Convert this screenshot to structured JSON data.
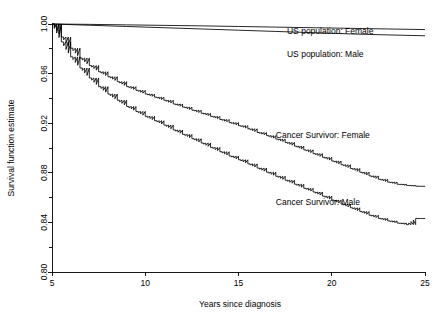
{
  "chart_data": {
    "type": "line",
    "title": "",
    "xlabel": "Years since diagnosis",
    "ylabel": "Survival function estimate",
    "xlim": [
      5,
      25
    ],
    "ylim": [
      0.8,
      1.0
    ],
    "xticks": [
      5,
      10,
      15,
      20,
      25
    ],
    "xtick_labels": [
      "5",
      "10",
      "15",
      "20",
      "25"
    ],
    "yticks": [
      0.8,
      0.84,
      0.88,
      0.92,
      0.96,
      1.0
    ],
    "ytick_labels": [
      "0.80",
      "0.84",
      "0.88",
      "0.92",
      "0.96",
      "1.00"
    ],
    "yminorticks": [
      0.82,
      0.86,
      0.9,
      0.94,
      0.98
    ],
    "grid": false,
    "legend_position": "inline-annotations",
    "series": [
      {
        "name": "US population: Female",
        "color": "#000000",
        "label_x": 17.6,
        "label_y": 0.9935,
        "x": [
          5,
          7,
          9,
          11,
          13,
          15,
          17,
          19,
          21,
          23,
          25
        ],
        "y": [
          1.0,
          0.9997,
          0.9993,
          0.9989,
          0.9985,
          0.998,
          0.9975,
          0.997,
          0.9965,
          0.996,
          0.9955
        ]
      },
      {
        "name": "US population: Male",
        "color": "#000000",
        "label_x": 17.6,
        "label_y": 0.9755,
        "x": [
          5,
          7,
          9,
          11,
          13,
          15,
          17,
          19,
          21,
          23,
          25
        ],
        "y": [
          1.0,
          0.999,
          0.998,
          0.997,
          0.996,
          0.995,
          0.994,
          0.993,
          0.992,
          0.9912,
          0.9905
        ]
      },
      {
        "name": "Cancer Survivor: Female",
        "color": "#000000",
        "label_x": 17.0,
        "label_y": 0.9095,
        "x": [
          5,
          5.5,
          6,
          6.5,
          7,
          7.5,
          8,
          8.5,
          9,
          9.5,
          10,
          10.5,
          11,
          11.5,
          12,
          12.5,
          13,
          13.5,
          14,
          14.5,
          15,
          15.5,
          16,
          16.5,
          17,
          17.5,
          18,
          18.5,
          19,
          19.5,
          20,
          20.5,
          21,
          21.5,
          22,
          22.5,
          23,
          23.5,
          24,
          24.5,
          25
        ],
        "y": [
          1.0,
          0.9895,
          0.9805,
          0.9725,
          0.9665,
          0.9615,
          0.9575,
          0.9535,
          0.9495,
          0.9465,
          0.9435,
          0.941,
          0.9385,
          0.9355,
          0.933,
          0.9305,
          0.928,
          0.9255,
          0.923,
          0.9205,
          0.918,
          0.9155,
          0.9125,
          0.91,
          0.9072,
          0.9045,
          0.9015,
          0.8985,
          0.8955,
          0.8925,
          0.8895,
          0.8865,
          0.8835,
          0.8805,
          0.8775,
          0.8748,
          0.8725,
          0.8708,
          0.8698,
          0.8692,
          0.869
        ]
      },
      {
        "name": "Cancer Survivor: Male",
        "color": "#000000",
        "label_x": 17.0,
        "label_y": 0.8555,
        "x": [
          5,
          5.5,
          6,
          6.5,
          7,
          7.5,
          8,
          8.5,
          9,
          9.5,
          10,
          10.5,
          11,
          11.5,
          12,
          12.5,
          13,
          13.5,
          14,
          14.5,
          15,
          15.5,
          16,
          16.5,
          17,
          17.5,
          18,
          18.5,
          19,
          19.5,
          20,
          20.5,
          21,
          21.5,
          22,
          22.5,
          23,
          23.5,
          24,
          24.5,
          25
        ],
        "y": [
          1.0,
          0.9855,
          0.9735,
          0.9645,
          0.9565,
          0.9495,
          0.9435,
          0.9385,
          0.9335,
          0.9295,
          0.9255,
          0.922,
          0.9185,
          0.9145,
          0.911,
          0.9075,
          0.904,
          0.9005,
          0.897,
          0.8935,
          0.8905,
          0.8872,
          0.8838,
          0.8805,
          0.8772,
          0.874,
          0.8708,
          0.8675,
          0.8645,
          0.8612,
          0.858,
          0.8548,
          0.8518,
          0.8488,
          0.8458,
          0.8432,
          0.8412,
          0.8395,
          0.8382,
          0.8432,
          0.843
        ]
      }
    ]
  },
  "axis": {
    "y_title": "Survival function estimate",
    "x_title": "Years since diagnosis"
  }
}
